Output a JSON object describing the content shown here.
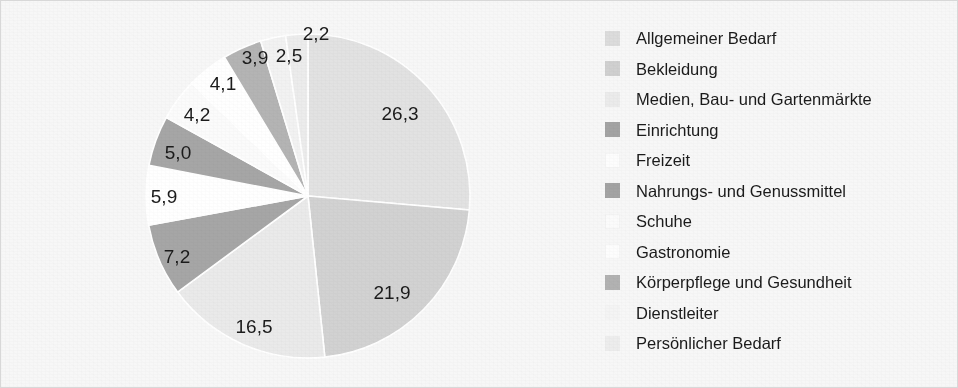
{
  "chart_data": {
    "type": "pie",
    "title": "",
    "subtitle": "",
    "xlabel": "",
    "ylabel": "",
    "legend_position": "right",
    "grid": false,
    "units": "percent",
    "value_format": "comma-decimal",
    "total": 99.7,
    "start_angle_deg": 0,
    "direction": "clockwise",
    "categories": [
      "Allgemeiner Bedarf",
      "Bekleidung",
      "Medien, Bau- und Gartenmärkte",
      "Einrichtung",
      "Freizeit",
      "Nahrungs- und Genussmittel",
      "Schuhe",
      "Gastronomie",
      "Körperpflege und Gesundheit",
      "Dienstleiter",
      "Persönlicher Bedarf"
    ],
    "values": [
      26.3,
      21.9,
      16.5,
      7.2,
      5.9,
      5.0,
      4.2,
      4.1,
      3.9,
      2.5,
      2.2
    ],
    "labels": [
      "26,3",
      "21,9",
      "16,5",
      "7,2",
      "5,9",
      "5,0",
      "4,2",
      "4,1",
      "3,9",
      "2,5",
      "2,2"
    ],
    "colors": [
      "#e2e2e2",
      "#d2d2d2",
      "#eaeaea",
      "#a6a6a6",
      "#ffffff",
      "#a6a6a6",
      "#fbfbfb",
      "#ffffff",
      "#b4b4b4",
      "#f2f2f2",
      "#ececec"
    ],
    "slices": [
      {
        "label": "26,3",
        "value": 26.3,
        "category": "Allgemeiner Bedarf",
        "color": "#e2e2e2",
        "label_x": 399,
        "label_y": 113
      },
      {
        "label": "21,9",
        "value": 21.9,
        "category": "Bekleidung",
        "color": "#d2d2d2",
        "label_x": 391,
        "label_y": 292
      },
      {
        "label": "16,5",
        "value": 16.5,
        "category": "Medien, Bau- und Gartenmärkte",
        "color": "#eaeaea",
        "label_x": 253,
        "label_y": 326
      },
      {
        "label": "7,2",
        "value": 7.2,
        "category": "Einrichtung",
        "color": "#a6a6a6",
        "label_x": 176,
        "label_y": 256
      },
      {
        "label": "5,9",
        "value": 5.9,
        "category": "Freizeit",
        "color": "#ffffff",
        "label_x": 163,
        "label_y": 196
      },
      {
        "label": "5,0",
        "value": 5.0,
        "category": "Nahrungs- und Genussmittel",
        "color": "#a6a6a6",
        "label_x": 177,
        "label_y": 152
      },
      {
        "label": "4,2",
        "value": 4.2,
        "category": "Schuhe",
        "color": "#fbfbfb",
        "label_x": 196,
        "label_y": 114
      },
      {
        "label": "4,1",
        "value": 4.1,
        "category": "Gastronomie",
        "color": "#ffffff",
        "label_x": 222,
        "label_y": 83
      },
      {
        "label": "3,9",
        "value": 3.9,
        "category": "Körperpflege und Gesundheit",
        "color": "#b4b4b4",
        "label_x": 254,
        "label_y": 57
      },
      {
        "label": "2,5",
        "value": 2.5,
        "category": "Dienstleiter",
        "color": "#f2f2f2",
        "label_x": 288,
        "label_y": 55
      },
      {
        "label": "2,2",
        "value": 2.2,
        "category": "Persönlicher Bedarf",
        "color": "#ececec",
        "label_x": 315,
        "label_y": 33
      }
    ],
    "geometry": {
      "center_x": 307,
      "center_y": 195,
      "radius": 162
    }
  },
  "legend": {
    "items": [
      {
        "label": "Allgemeiner Bedarf",
        "color": "#dcdcdc"
      },
      {
        "label": "Bekleidung",
        "color": "#d0d0d0"
      },
      {
        "label": "Medien, Bau- und Gartenmärkte",
        "color": "#ebebeb"
      },
      {
        "label": "Einrichtung",
        "color": "#a3a3a3"
      },
      {
        "label": "Freizeit",
        "color": "#fdfdfd"
      },
      {
        "label": "Nahrungs- und Genussmittel",
        "color": "#a3a3a3"
      },
      {
        "label": "Schuhe",
        "color": "#fbfbfb"
      },
      {
        "label": "Gastronomie",
        "color": "#fdfdfd"
      },
      {
        "label": "Körperpflege und Gesundheit",
        "color": "#b2b2b2"
      },
      {
        "label": "Dienstleiter",
        "color": "#f4f4f4"
      },
      {
        "label": "Persönlicher Bedarf",
        "color": "#ededed"
      }
    ]
  }
}
